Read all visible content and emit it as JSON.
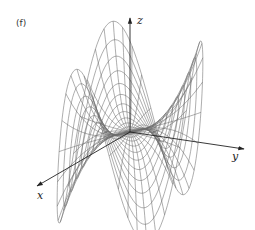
{
  "figure": {
    "panel_label": "(f)",
    "axes": {
      "x_label": "x",
      "y_label": "y",
      "z_label": "z"
    },
    "colors": {
      "mesh": "#6b6b6b",
      "axis": "#222222",
      "background": "#ffffff"
    },
    "surface": {
      "description": "Wireframe of a six-lobed saddle surface (three raised lobes, three lowered lobes) over a disk",
      "type": "polar-wireframe",
      "lobes": 3,
      "radial_rings": 12,
      "angular_spokes": 48,
      "radius": 1.0
    },
    "projection": {
      "origin": [
        130,
        132
      ],
      "x_dir": [
        -0.92,
        0.53
      ],
      "y_dir": [
        1.13,
        0.17
      ],
      "z_dir": [
        0,
        -1
      ],
      "scale_xy": 100,
      "scale_z": 88
    },
    "axis_geometry": {
      "z": {
        "from": [
          130,
          132
        ],
        "to": [
          130,
          18
        ]
      },
      "x": {
        "from": [
          130,
          132
        ],
        "to": [
          37,
          186
        ]
      },
      "y": {
        "from": [
          130,
          132
        ],
        "to": [
          244,
          149
        ]
      }
    },
    "label_positions": {
      "z": [
        137,
        14
      ],
      "x": [
        37,
        189
      ],
      "y": [
        232,
        150
      ]
    }
  }
}
